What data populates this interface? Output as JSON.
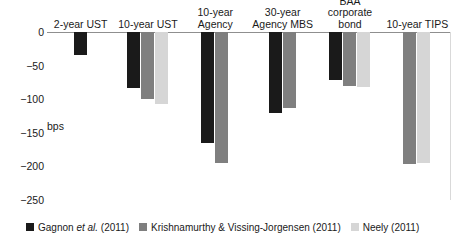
{
  "chart_data": {
    "type": "bar",
    "title": "",
    "xlabel": "",
    "ylabel": "bps",
    "ylim": [
      -250,
      0
    ],
    "yticks": [
      0,
      -50,
      -100,
      -150,
      -200,
      -250
    ],
    "ytick_labels": [
      "0",
      "−50",
      "−100",
      "−150",
      "−200",
      "−250"
    ],
    "grid": false,
    "legend_position": "bottom",
    "categories": [
      "2-year UST",
      "10-year UST",
      "10-year\nAgency",
      "30-year\nAgency MBS",
      "BAA corporate\nbond",
      "10-year TIPS"
    ],
    "series": [
      {
        "name": "Gagnon et al. (2011)",
        "color": "#1a1a1a",
        "values": [
          -34,
          -84,
          -165,
          -120,
          -72,
          null
        ]
      },
      {
        "name": "Krishnamurthy & Vissing-Jorgensen (2011)",
        "color": "#7f7f7f",
        "values": [
          null,
          -99,
          -195,
          -113,
          -80,
          -197
        ]
      },
      {
        "name": "Neely (2011)",
        "color": "#d6d6d6",
        "values": [
          null,
          -107,
          null,
          null,
          -82,
          -195
        ]
      }
    ]
  },
  "axis": {
    "unit_label": "bps"
  },
  "categories": [
    {
      "line1": "2-year UST",
      "line2": ""
    },
    {
      "line1": "10-year UST",
      "line2": ""
    },
    {
      "line1": "10-year",
      "line2": "Agency"
    },
    {
      "line1": "30-year",
      "line2": "Agency MBS"
    },
    {
      "line1": "BAA corporate",
      "line2": "bond"
    },
    {
      "line1": "10-year TIPS",
      "line2": ""
    }
  ],
  "yticks": [
    {
      "label": "0"
    },
    {
      "label": "−50"
    },
    {
      "label": "−100"
    },
    {
      "label": "−150"
    },
    {
      "label": "−200"
    },
    {
      "label": "−250"
    }
  ],
  "legend": [
    {
      "prefix": "Gagnon ",
      "italic": "et al.",
      "suffix": " (2011)",
      "color": "#1a1a1a"
    },
    {
      "prefix": "Krishnamurthy & Vissing-Jorgensen (2011)",
      "italic": "",
      "suffix": "",
      "color": "#7f7f7f"
    },
    {
      "prefix": "Neely (2011)",
      "italic": "",
      "suffix": "",
      "color": "#d6d6d6"
    }
  ]
}
